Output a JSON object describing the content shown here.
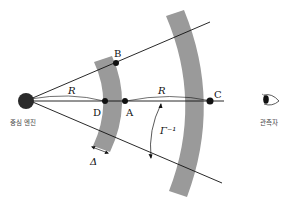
{
  "diagram": {
    "colors": {
      "band": "#9a9a9a",
      "line": "#111111",
      "point": "#111111",
      "engine": "#2a2a2a",
      "text": "#111111",
      "caption": "#444444"
    },
    "labels": {
      "engine": "중심 엔진",
      "observer": "관측자",
      "point_A": "A",
      "point_B": "B",
      "point_C": "C",
      "point_D": "D",
      "distance_R_left": "R",
      "distance_R_right": "R",
      "shell_thickness": "Δ",
      "beam_angle": "Γ⁻¹"
    }
  }
}
